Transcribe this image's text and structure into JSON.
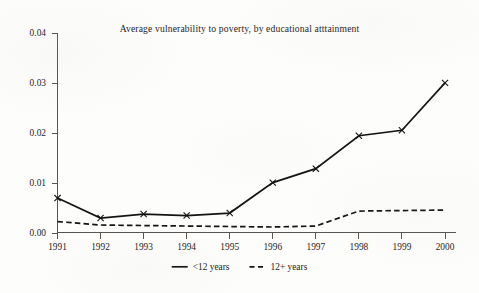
{
  "chart_data": {
    "type": "line",
    "title": "Average vulnerability to poverty, by educational atttainment",
    "xlabel": "",
    "ylabel": "",
    "categories": [
      "1991",
      "1992",
      "1993",
      "1994",
      "1995",
      "1996",
      "1997",
      "1998",
      "1999",
      "2000"
    ],
    "x": [
      1991,
      1992,
      1993,
      1994,
      1995,
      1996,
      1997,
      1998,
      1999,
      2000
    ],
    "xlim": [
      1991,
      2000
    ],
    "ylim": [
      0.0,
      0.04
    ],
    "ytick_labels": [
      "0.00",
      "0.01",
      "0.02",
      "0.03",
      "0.04"
    ],
    "ytick_values": [
      0.0,
      0.01,
      0.02,
      0.03,
      0.04
    ],
    "grid": false,
    "legend_position": "bottom-center",
    "series": [
      {
        "name": "<12 years",
        "style": "solid",
        "marker": "x",
        "values": [
          0.0069,
          0.0029,
          0.0037,
          0.0034,
          0.0039,
          0.01,
          0.0128,
          0.0194,
          0.0205,
          0.03
        ]
      },
      {
        "name": "12+ years",
        "style": "dashed",
        "marker": "none",
        "values": [
          0.0022,
          0.0015,
          0.0014,
          0.0013,
          0.0012,
          0.0011,
          0.0013,
          0.0043,
          0.0044,
          0.0045
        ]
      }
    ]
  },
  "legend": {
    "items": [
      {
        "label": "<12 years",
        "style": "solid"
      },
      {
        "label": "12+ years",
        "style": "dashed"
      }
    ]
  },
  "colors": {
    "ink": "#141414",
    "axis": "#585450",
    "paper": "#fdfdfc"
  }
}
